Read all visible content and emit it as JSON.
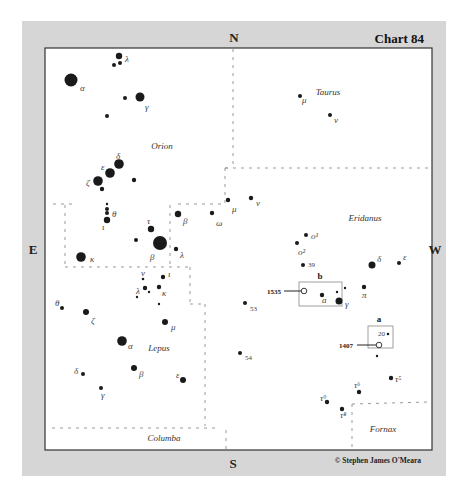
{
  "chart_title": "Chart 84",
  "compass": {
    "north": "N",
    "south": "S",
    "east": "E",
    "west": "W"
  },
  "copyright": "© Stephen James O'Meara",
  "constellations": [
    {
      "name": "Orion",
      "x": 162,
      "y": 149
    },
    {
      "name": "Taurus",
      "x": 328,
      "y": 95
    },
    {
      "name": "Eridanus",
      "x": 365,
      "y": 221
    },
    {
      "name": "Lepus",
      "x": 159,
      "y": 351
    },
    {
      "name": "Columba",
      "x": 164,
      "y": 441
    },
    {
      "name": "Fornax",
      "x": 383,
      "y": 432
    }
  ],
  "stars": [
    {
      "x": 119,
      "y": 56,
      "r": 3.2,
      "label": "λ",
      "lx": 125,
      "ly": 62
    },
    {
      "x": 120,
      "y": 63,
      "r": 2,
      "label": "",
      "lx": 0,
      "ly": 0
    },
    {
      "x": 114,
      "y": 65,
      "r": 2,
      "label": "",
      "lx": 0,
      "ly": 0
    },
    {
      "x": 71,
      "y": 80,
      "r": 6.5,
      "label": "α",
      "lx": 80,
      "ly": 91
    },
    {
      "x": 140,
      "y": 97,
      "r": 4.5,
      "label": "γ",
      "lx": 145,
      "ly": 110
    },
    {
      "x": 125,
      "y": 98,
      "r": 2,
      "label": "",
      "lx": 0,
      "ly": 0
    },
    {
      "x": 107,
      "y": 116,
      "r": 2,
      "label": "",
      "lx": 0,
      "ly": 0
    },
    {
      "x": 119,
      "y": 164,
      "r": 4.8,
      "label": "δ",
      "lx": 116,
      "ly": 159
    },
    {
      "x": 110,
      "y": 173,
      "r": 4.8,
      "label": "ε",
      "lx": 101,
      "ly": 170
    },
    {
      "x": 98,
      "y": 181,
      "r": 4.8,
      "label": "ζ",
      "lx": 86,
      "ly": 186
    },
    {
      "x": 102,
      "y": 189,
      "r": 2.2,
      "label": "",
      "lx": 0,
      "ly": 0
    },
    {
      "x": 134,
      "y": 180,
      "r": 2.2,
      "label": "",
      "lx": 0,
      "ly": 0
    },
    {
      "x": 107,
      "y": 204,
      "r": 1.2,
      "label": "",
      "lx": 0,
      "ly": 0
    },
    {
      "x": 107,
      "y": 209,
      "r": 2,
      "label": "",
      "lx": 0,
      "ly": 0
    },
    {
      "x": 107,
      "y": 213,
      "r": 2,
      "label": "θ",
      "lx": 112,
      "ly": 217
    },
    {
      "x": 107,
      "y": 220,
      "r": 3.2,
      "label": "ι",
      "lx": 102,
      "ly": 230
    },
    {
      "x": 178,
      "y": 214,
      "r": 3.2,
      "label": "β",
      "lx": 183,
      "ly": 224
    },
    {
      "x": 151,
      "y": 229,
      "r": 3.2,
      "label": "τ",
      "lx": 147,
      "ly": 224
    },
    {
      "x": 136,
      "y": 240,
      "r": 2,
      "label": "",
      "lx": 0,
      "ly": 0
    },
    {
      "x": 160,
      "y": 243,
      "r": 7,
      "label": "β",
      "lx": 150,
      "ly": 260
    },
    {
      "x": 176,
      "y": 249,
      "r": 2.2,
      "label": "λ",
      "lx": 180,
      "ly": 258
    },
    {
      "x": 228,
      "y": 200,
      "r": 2.2,
      "label": "μ",
      "lx": 232,
      "ly": 212
    },
    {
      "x": 251,
      "y": 198,
      "r": 2.2,
      "label": "ν",
      "lx": 256,
      "ly": 206
    },
    {
      "x": 212,
      "y": 213,
      "r": 2.2,
      "label": "ω",
      "lx": 216,
      "ly": 226
    },
    {
      "x": 81,
      "y": 257,
      "r": 4.8,
      "label": "κ",
      "lx": 90,
      "ly": 262
    },
    {
      "x": 143,
      "y": 279,
      "r": 1.3,
      "label": "ν",
      "lx": 141,
      "ly": 276
    },
    {
      "x": 163,
      "y": 277,
      "r": 2.2,
      "label": "ι",
      "lx": 168,
      "ly": 277
    },
    {
      "x": 145,
      "y": 288,
      "r": 2.2,
      "label": "λ",
      "lx": 136,
      "ly": 294
    },
    {
      "x": 149,
      "y": 292,
      "r": 1.2,
      "label": "",
      "lx": 0,
      "ly": 0
    },
    {
      "x": 137,
      "y": 297,
      "r": 1.2,
      "label": "",
      "lx": 0,
      "ly": 0
    },
    {
      "x": 159,
      "y": 287,
      "r": 2.2,
      "label": "κ",
      "lx": 162,
      "ly": 296
    },
    {
      "x": 159,
      "y": 304,
      "r": 1.2,
      "label": "",
      "lx": 0,
      "ly": 0
    },
    {
      "x": 62,
      "y": 308,
      "r": 2,
      "label": "θ",
      "lx": 55,
      "ly": 306
    },
    {
      "x": 86,
      "y": 312,
      "r": 3,
      "label": "ζ",
      "lx": 91,
      "ly": 324
    },
    {
      "x": 165,
      "y": 322,
      "r": 3,
      "label": "μ",
      "lx": 171,
      "ly": 330
    },
    {
      "x": 122,
      "y": 341,
      "r": 4.8,
      "label": "α",
      "lx": 128,
      "ly": 349
    },
    {
      "x": 134,
      "y": 368,
      "r": 3,
      "label": "β",
      "lx": 139,
      "ly": 377
    },
    {
      "x": 183,
      "y": 380,
      "r": 3,
      "label": "ε",
      "lx": 176,
      "ly": 378
    },
    {
      "x": 83,
      "y": 374,
      "r": 2,
      "label": "δ",
      "lx": 74,
      "ly": 374
    },
    {
      "x": 101,
      "y": 388,
      "r": 2,
      "label": "γ",
      "lx": 101,
      "ly": 398
    },
    {
      "x": 300,
      "y": 96,
      "r": 2,
      "label": "μ",
      "lx": 302,
      "ly": 103
    },
    {
      "x": 330,
      "y": 115,
      "r": 2,
      "label": "ν",
      "lx": 334,
      "ly": 123
    },
    {
      "x": 306,
      "y": 235,
      "r": 2,
      "label": "o¹",
      "lx": 311,
      "ly": 239
    },
    {
      "x": 297,
      "y": 243,
      "r": 2,
      "label": "o²",
      "lx": 298,
      "ly": 255
    },
    {
      "x": 303,
      "y": 265,
      "r": 2,
      "label": "39",
      "lx": 308,
      "ly": 267
    },
    {
      "x": 322,
      "y": 295,
      "r": 2.2,
      "label": "a",
      "lx": 322,
      "ly": 303
    },
    {
      "x": 337,
      "y": 292,
      "r": 1.2,
      "label": "",
      "lx": 0,
      "ly": 0
    },
    {
      "x": 339,
      "y": 301,
      "r": 3.5,
      "label": "γ",
      "lx": 345,
      "ly": 307
    },
    {
      "x": 345,
      "y": 288,
      "r": 1.2,
      "label": "",
      "lx": 0,
      "ly": 0
    },
    {
      "x": 364,
      "y": 287,
      "r": 2.2,
      "label": "π",
      "lx": 362,
      "ly": 298
    },
    {
      "x": 372,
      "y": 265,
      "r": 3.5,
      "label": "δ",
      "lx": 377,
      "ly": 262
    },
    {
      "x": 399,
      "y": 263,
      "r": 2,
      "label": "ε",
      "lx": 403,
      "ly": 260
    },
    {
      "x": 245,
      "y": 303,
      "r": 2,
      "label": "53",
      "lx": 250,
      "ly": 311
    },
    {
      "x": 240,
      "y": 353,
      "r": 2,
      "label": "54",
      "lx": 245,
      "ly": 360
    },
    {
      "x": 388,
      "y": 334,
      "r": 1.3,
      "label": "20",
      "lx": 378,
      "ly": 336
    },
    {
      "x": 377,
      "y": 356,
      "r": 1.2,
      "label": "",
      "lx": 0,
      "ly": 0
    },
    {
      "x": 391,
      "y": 378,
      "r": 2.2,
      "label": "τ⁵",
      "lx": 395,
      "ly": 382
    },
    {
      "x": 359,
      "y": 392,
      "r": 2.2,
      "label": "τ⁶",
      "lx": 354,
      "ly": 388
    },
    {
      "x": 327,
      "y": 402,
      "r": 2.2,
      "label": "τ⁹",
      "lx": 320,
      "ly": 401
    },
    {
      "x": 342,
      "y": 409,
      "r": 2.2,
      "label": "τ⁸",
      "lx": 340,
      "ly": 418
    }
  ],
  "insets": [
    {
      "label": "b",
      "box": {
        "x": 299,
        "y": 282,
        "w": 43,
        "h": 24
      },
      "lx": 320,
      "ly": 279
    },
    {
      "label": "a",
      "box": {
        "x": 368,
        "y": 326,
        "w": 25,
        "h": 22
      },
      "lx": 379,
      "ly": 322
    }
  ],
  "objects": [
    {
      "id": "1535",
      "x": 304,
      "y": 291,
      "label": "1535",
      "line_x1": 284,
      "lx": 281,
      "ly": 294
    },
    {
      "id": "1407",
      "x": 379,
      "y": 345,
      "label": "1407",
      "line_x1": 357,
      "lx": 353,
      "ly": 348
    }
  ]
}
